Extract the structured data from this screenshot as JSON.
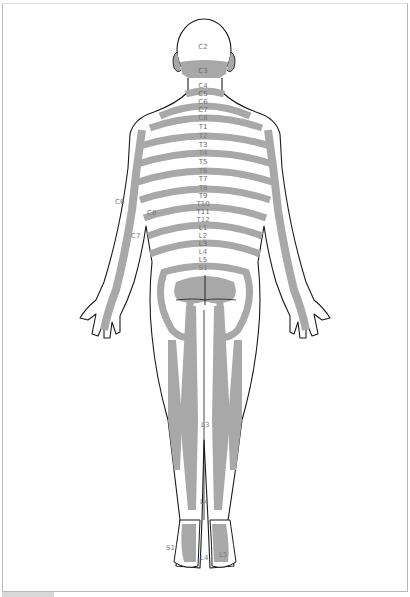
{
  "diagram": {
    "type": "dermatome-map",
    "view": "posterior",
    "colors": {
      "band": "#a8a8a8",
      "skin": "#ffffff",
      "outline": "#1a1a1a",
      "label": "#7a7a7a",
      "frame": "#b8b8b8"
    },
    "spine_labels": [
      "C2",
      "C3",
      "C4",
      "C5",
      "C6",
      "C7",
      "C8",
      "T1",
      "T2",
      "T3",
      "T4",
      "T5",
      "T6",
      "T7",
      "T8",
      "T9",
      "T10",
      "T11",
      "T12",
      "L1",
      "L2",
      "L3",
      "L4",
      "L5",
      "S1"
    ],
    "side_labels": {
      "arm_c6": "C6",
      "arm_c8": "C8",
      "arm_c7": "C7"
    },
    "leg_labels": {
      "thigh_l3": "L3",
      "ankle_l4": "L4",
      "foot_s1": "S1",
      "foot_l4": "L4",
      "foot_l5": "L5"
    }
  }
}
